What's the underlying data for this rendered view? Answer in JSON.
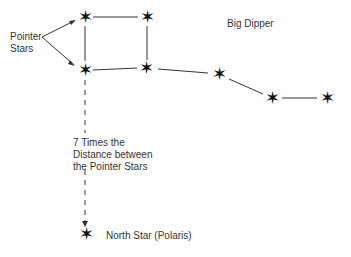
{
  "title": "Big Dipper",
  "labels": {
    "pointer_stars": "Pointer\nStars",
    "distance_note": "7 Times the\nDistance between\nthe Pointer Stars",
    "north_star": "North Star (Polaris)"
  },
  "star_glyph": "✶",
  "stars": [
    {
      "name": "dubhe",
      "x": 85,
      "y": 17
    },
    {
      "name": "bowl-top-right",
      "x": 147,
      "y": 17
    },
    {
      "name": "merak",
      "x": 85,
      "y": 70
    },
    {
      "name": "bowl-bottom-right",
      "x": 146,
      "y": 68
    },
    {
      "name": "handle-1",
      "x": 219,
      "y": 74
    },
    {
      "name": "handle-2",
      "x": 272,
      "y": 98
    },
    {
      "name": "handle-3",
      "x": 327,
      "y": 98
    },
    {
      "name": "polaris",
      "x": 86,
      "y": 234
    }
  ],
  "colors": {
    "line": "#333333",
    "star": "#111111",
    "text": "#333333"
  }
}
